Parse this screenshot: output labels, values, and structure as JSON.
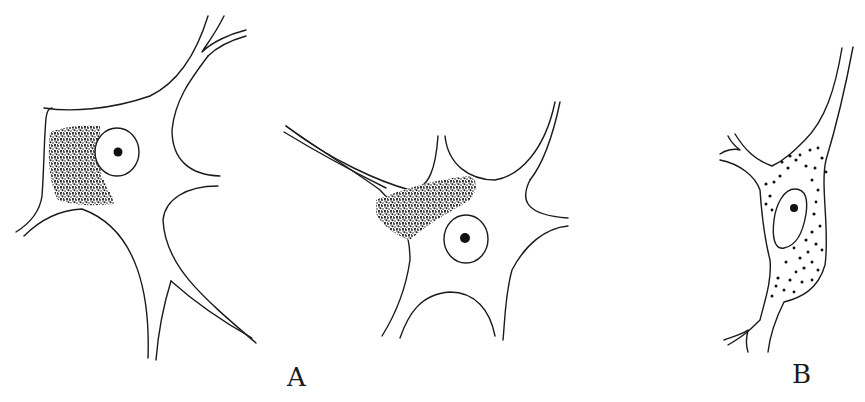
{
  "figure": {
    "type": "scientific-illustration",
    "background": "#ffffff",
    "ink_color": "#1a1a1a",
    "labels": [
      {
        "id": "A",
        "text": "A",
        "x": 287,
        "y": 364
      },
      {
        "id": "B",
        "text": "B",
        "x": 792,
        "y": 361
      }
    ],
    "cells": [
      {
        "id": "cell-1",
        "group": "A",
        "granules": "dense clumped mass left of nucleus",
        "nucleus_center": [
          120,
          152
        ]
      },
      {
        "id": "cell-2",
        "group": "A",
        "granules": "dense clumped mass above-left of nucleus",
        "nucleus_center": [
          466,
          239
        ]
      },
      {
        "id": "cell-3",
        "group": "B",
        "granules": "scattered discrete dots around nucleus",
        "nucleus_center": [
          793,
          207
        ]
      }
    ]
  }
}
